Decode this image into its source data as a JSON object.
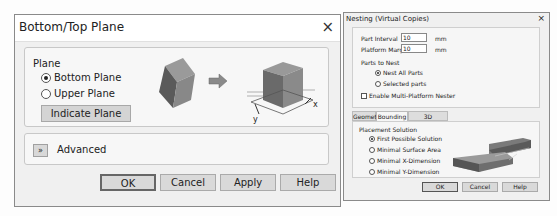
{
  "left_dialog": {
    "title": "Bottom/Top Plane",
    "close_icon": "×",
    "plane_group": {
      "label": "Plane",
      "options": [
        {
          "label": "Bottom Plane",
          "selected": true
        },
        {
          "label": "Upper Plane",
          "selected": false
        }
      ],
      "indicate_button": "Indicate Plane"
    },
    "illustration": {
      "axis_x": "x",
      "axis_y": "y"
    },
    "advanced": {
      "icon": "»",
      "label": "Advanced"
    },
    "buttons": {
      "ok": "OK",
      "cancel": "Cancel",
      "apply": "Apply",
      "help": "Help"
    }
  },
  "right_dialog": {
    "title": "Nesting (Virtual Copies)",
    "close_icon": "×",
    "fields": [
      {
        "label": "Part Interval",
        "value": "10",
        "unit": "mm"
      },
      {
        "label": "Platform Margin",
        "value": "10",
        "unit": "mm"
      }
    ],
    "parts_to_nest": {
      "label": "Parts to Nest",
      "options": [
        {
          "label": "Nest All Parts",
          "selected": true
        },
        {
          "label": "Selected parts",
          "selected": false
        }
      ]
    },
    "multi_platform": {
      "label": "Enable Multi-Platform Nester",
      "checked": false
    },
    "tabs": [
      {
        "label": "Geometry",
        "active": false
      },
      {
        "label": "Bounding Box",
        "active": true
      },
      {
        "label": "3D Bounding Box",
        "active": false
      }
    ],
    "placement": {
      "label": "Placement Solution",
      "options": [
        {
          "label": "First Possible Solution",
          "selected": true
        },
        {
          "label": "Minimal Surface Area",
          "selected": false
        },
        {
          "label": "Minimal X-Dimension",
          "selected": false
        },
        {
          "label": "Minimal Y-Dimension",
          "selected": false
        }
      ]
    },
    "buttons": {
      "ok": "OK",
      "cancel": "Cancel",
      "help": "Help"
    }
  }
}
